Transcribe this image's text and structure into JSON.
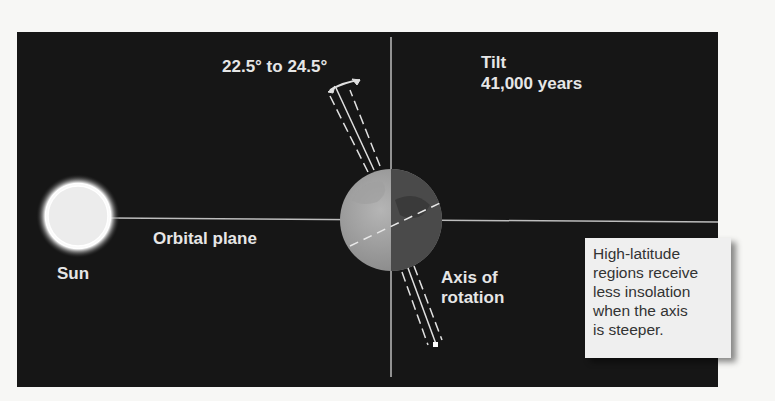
{
  "diagram": {
    "title_label": "Tilt",
    "period_label": "41,000 years",
    "tilt_range_label": "22.5° to 24.5°",
    "orbital_plane_label": "Orbital plane",
    "sun_label": "Sun",
    "axis_label_line1": "Axis of",
    "axis_label_line2": "rotation",
    "callout_lines": [
      "High-latitude",
      "regions receive",
      "less insolation",
      "when the axis",
      "is steeper."
    ],
    "colors": {
      "panel": "#161616",
      "text": "#e6e6e6",
      "callout_bg": "#efefef",
      "callout_text": "#333333"
    }
  }
}
